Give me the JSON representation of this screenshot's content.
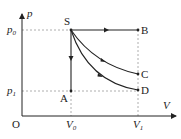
{
  "diagram": {
    "type": "p-V diagram",
    "axes": {
      "y_label": "p",
      "x_label": "V",
      "origin": "O"
    },
    "ticks": {
      "p0": {
        "main": "p",
        "sub": "0"
      },
      "p1": {
        "main": "p",
        "sub": "1"
      },
      "V0": {
        "main": "V",
        "sub": "0"
      },
      "V1": {
        "main": "V",
        "sub": "1"
      }
    },
    "points": {
      "S": "S",
      "A": "A",
      "B": "B",
      "C": "C",
      "D": "D"
    },
    "processes": [
      {
        "from": "S",
        "to": "B",
        "shape": "horizontal line (isobaric)"
      },
      {
        "from": "S",
        "to": "A",
        "shape": "vertical line (isochoric)"
      },
      {
        "from": "S",
        "to": "C",
        "shape": "curve"
      },
      {
        "from": "S",
        "to": "D",
        "shape": "curve"
      }
    ],
    "colors": {
      "line": "#222222",
      "dashed": "#999999"
    }
  }
}
